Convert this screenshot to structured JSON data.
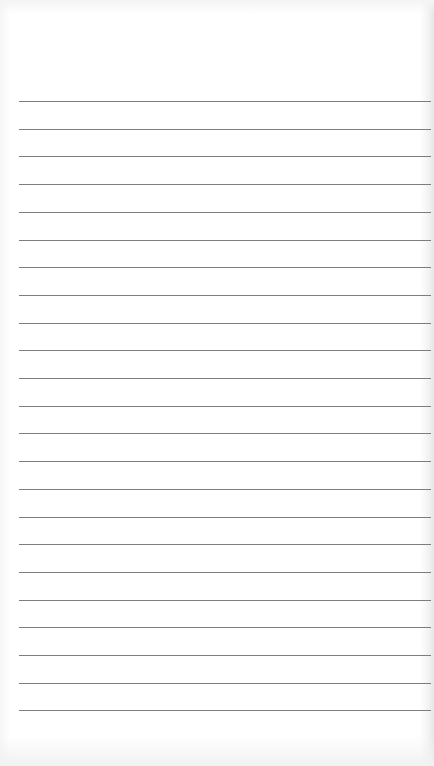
{
  "page": {
    "type": "lined-notepaper",
    "line_count": 23,
    "first_line_y": 101,
    "line_spacing": 27.7,
    "line_color": "#7d7d7d",
    "paper_color": "#ffffff"
  }
}
